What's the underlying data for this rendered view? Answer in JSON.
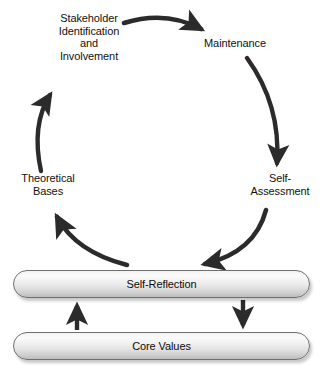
{
  "diagram": {
    "cycle_nodes": [
      {
        "id": "stakeholder",
        "label": "Stakeholder\nIdentification\nand\nInvolvement"
      },
      {
        "id": "maintenance",
        "label": "Maintenance"
      },
      {
        "id": "self_assessment",
        "label": "Self-\nAssessment"
      },
      {
        "id": "theoretical_bases",
        "label": "Theoretical\nBases"
      }
    ],
    "boxes": [
      {
        "id": "self_reflection",
        "label": "Self-Reflection"
      },
      {
        "id": "core_values",
        "label": "Core Values"
      }
    ],
    "colors": {
      "arrow": "#2b2b2b",
      "text": "#111111",
      "box_border": "#6f6f6f",
      "box_fill_light": "#fbfbfb",
      "box_fill_dark": "#bdbdbd",
      "background": "#ffffff"
    },
    "connectors": [
      {
        "id": "stakeholder-to-maintenance",
        "from": "stakeholder",
        "to": "maintenance",
        "style": "curved-arrow"
      },
      {
        "id": "maintenance-to-self-assessment",
        "from": "maintenance",
        "to": "self_assessment",
        "style": "curved-arrow"
      },
      {
        "id": "self-assessment-to-self-reflection",
        "from": "self_assessment",
        "to": "self_reflection",
        "style": "curved-arrow"
      },
      {
        "id": "self-reflection-to-theoretical-bases",
        "from": "self_reflection",
        "to": "theoretical_bases",
        "style": "curved-arrow"
      },
      {
        "id": "theoretical-bases-to-stakeholder",
        "from": "theoretical_bases",
        "to": "stakeholder",
        "style": "curved-arrow"
      },
      {
        "id": "core-values-to-self-reflection",
        "from": "core_values",
        "to": "self_reflection",
        "style": "straight-arrow-up"
      },
      {
        "id": "self-reflection-to-core-values",
        "from": "self_reflection",
        "to": "core_values",
        "style": "straight-arrow-down"
      }
    ]
  }
}
